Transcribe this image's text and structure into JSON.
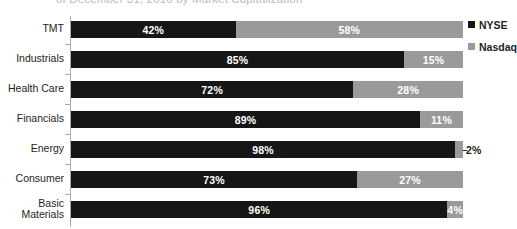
{
  "chart_data": {
    "type": "bar",
    "subtype": "stacked-horizontal-100pct",
    "title": "of December 31, 2016 by Market Capitalization",
    "xlabel": "",
    "ylabel": "",
    "xlim": [
      0,
      100
    ],
    "grid": false,
    "legend_position": "right",
    "categories": [
      "TMT",
      "Industrials",
      "Health Care",
      "Financials",
      "Energy",
      "Consumer",
      "Basic\nMaterials"
    ],
    "series": [
      {
        "name": "NYSE",
        "color": "#161616",
        "values": [
          42,
          85,
          72,
          89,
          98,
          73,
          96
        ],
        "labels": [
          "42%",
          "85%",
          "72%",
          "89%",
          "98%",
          "73%",
          "96%"
        ]
      },
      {
        "name": "Nasdaq",
        "color": "#9a9a9a",
        "values": [
          58,
          15,
          28,
          11,
          2,
          27,
          4
        ],
        "labels": [
          "58%",
          "15%",
          "28%",
          "11%",
          "2%",
          "27%",
          "4%"
        ],
        "label_outside": [
          false,
          false,
          false,
          false,
          true,
          false,
          false
        ]
      }
    ]
  },
  "legend": {
    "items": [
      {
        "label": "NYSE",
        "color": "#161616"
      },
      {
        "label": "Nasdaq",
        "color": "#9a9a9a"
      }
    ]
  }
}
